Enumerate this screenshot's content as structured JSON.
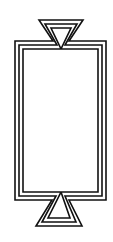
{
  "figure": {
    "stroke_color": "#111111",
    "background": "#ffffff",
    "line_count": 3
  }
}
